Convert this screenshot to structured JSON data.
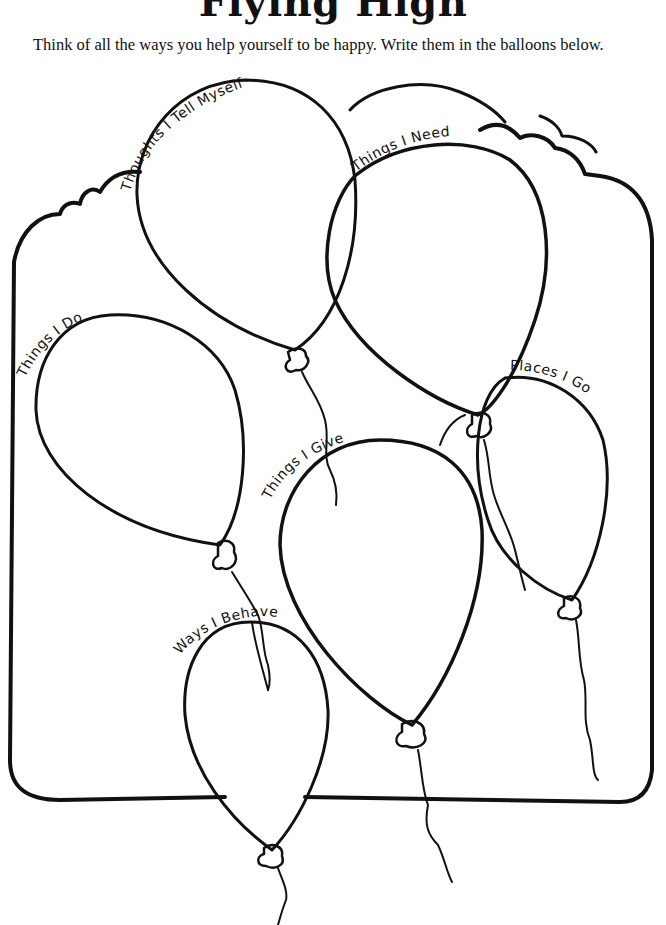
{
  "worksheet": {
    "title": "Flying High",
    "instructions": "Think of all the ways you help yourself to be happy. Write them in the balloons below."
  },
  "balloons": [
    {
      "id": "thoughts",
      "label": "Thoughts I Tell Myself"
    },
    {
      "id": "need",
      "label": "Things I Need"
    },
    {
      "id": "do",
      "label": "Things I Do"
    },
    {
      "id": "places",
      "label": "Places I Go"
    },
    {
      "id": "give",
      "label": "Things I Give"
    },
    {
      "id": "behave",
      "label": "Ways I Behave"
    }
  ],
  "colors": {
    "ink": "#111111",
    "paper": "#ffffff"
  }
}
